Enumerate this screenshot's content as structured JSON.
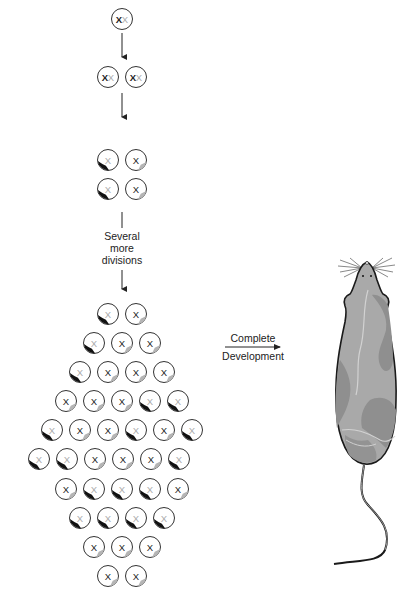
{
  "labels": {
    "several_more_divisions": [
      "Several",
      "more",
      "divisions"
    ],
    "complete_development": [
      "Complete",
      "Development"
    ]
  },
  "colors": {
    "outline": "#333333",
    "active_x": "#222222",
    "inactive_x": "#aaaaaa",
    "black_patch": "#111111",
    "grey_patch": "#b5b5b5",
    "mouse_body": "#a8a8a8",
    "mouse_patch": "#8e8e8e",
    "mouse_outline": "#1a1a1a"
  },
  "legend_note": "Cell types: 'zygote' = two active X (XX), 'early' = XX both shown, 'black' = paternal X inactivated (black patch, grey X), 'grey' = maternal X inactivated (grey patch, dark X)",
  "stages": [
    {
      "name": "zygote",
      "rows": [
        [
          "XX"
        ]
      ]
    },
    {
      "name": "two-cell",
      "rows": [
        [
          "XX",
          "XX"
        ]
      ]
    },
    {
      "name": "four-cell",
      "rows": [
        [
          "black",
          "grey"
        ],
        [
          "black",
          "grey"
        ]
      ]
    }
  ],
  "blastocyst_rows": [
    [
      "black",
      "grey"
    ],
    [
      "black",
      "grey",
      "grey"
    ],
    [
      "black",
      "grey",
      "grey",
      "grey"
    ],
    [
      "grey",
      "grey",
      "grey",
      "black",
      "black"
    ],
    [
      "black",
      "grey",
      "grey",
      "black",
      "grey",
      "black"
    ],
    [
      "black",
      "black",
      "grey",
      "grey",
      "grey",
      "black"
    ],
    [
      "grey",
      "black",
      "black",
      "black",
      "grey"
    ],
    [
      "black",
      "black",
      "black",
      "black"
    ],
    [
      "grey",
      "grey",
      "grey"
    ],
    [
      "grey",
      "grey"
    ]
  ]
}
